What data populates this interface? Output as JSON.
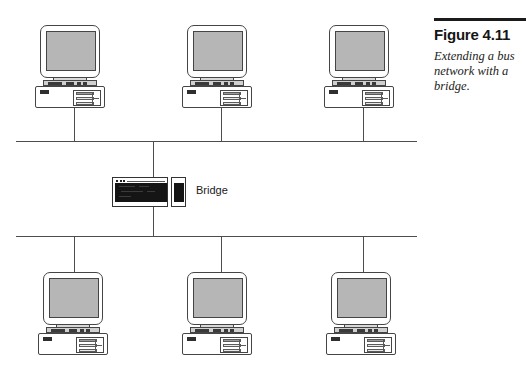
{
  "figure": {
    "number_label": "Figure 4.11",
    "caption": "Extending a bus network with a bridge.",
    "caption_lines": [
      "Extending a bus",
      "network with a",
      "bridge."
    ]
  },
  "diagram": {
    "type": "network-topology",
    "device_label_bridge": "Bridge",
    "colors": {
      "line": "#4d4d4d",
      "screen": "#b6b6b6",
      "outline": "#454545",
      "bridge_dark": "#151515",
      "rule": "#1b1b1b",
      "background": "#ffffff"
    },
    "buses": [
      {
        "name": "upper-bus",
        "y": 141,
        "x1": 16,
        "x2": 417
      },
      {
        "name": "lower-bus",
        "y": 236,
        "x1": 16,
        "x2": 417
      }
    ],
    "bridge": {
      "x": 112,
      "y": 177,
      "connects": [
        "upper-bus",
        "lower-bus"
      ]
    },
    "top_row_computers": [
      {
        "name": "computer-top-1",
        "x": 33,
        "y": 25
      },
      {
        "name": "computer-top-2",
        "x": 180,
        "y": 25
      },
      {
        "name": "computer-top-3",
        "x": 322,
        "y": 25
      }
    ],
    "bottom_row_computers": [
      {
        "name": "computer-bottom-1",
        "x": 36,
        "y": 272
      },
      {
        "name": "computer-bottom-2",
        "x": 180,
        "y": 272
      },
      {
        "name": "computer-bottom-3",
        "x": 324,
        "y": 272
      }
    ]
  }
}
